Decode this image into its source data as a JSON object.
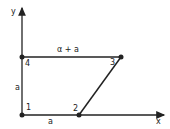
{
  "diagram": {
    "axes": {
      "x_label": "x",
      "y_label": "y"
    },
    "points": [
      {
        "id": "1",
        "label": "1"
      },
      {
        "id": "2",
        "label": "2"
      },
      {
        "id": "3",
        "label": "3"
      },
      {
        "id": "4",
        "label": "4"
      }
    ],
    "edges": {
      "bottom": "a",
      "left": "a",
      "top": "α + a"
    },
    "colors": {
      "line": "#222222",
      "background": "#ffffff"
    }
  }
}
